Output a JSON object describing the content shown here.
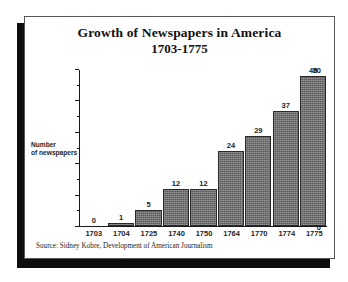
{
  "chart_data": {
    "type": "bar",
    "title": "Growth of Newspapers in America",
    "subtitle": "1703-1775",
    "xlabel": "",
    "ylabel": "Number of newspapers",
    "ylabel_line1": "Number",
    "ylabel_line2": "of newspapers",
    "categories": [
      "1703",
      "1704",
      "1725",
      "1740",
      "1750",
      "1764",
      "1770",
      "1774",
      "1775"
    ],
    "values": [
      0,
      1,
      5,
      12,
      12,
      24,
      29,
      37,
      48
    ],
    "value_labels": [
      "0",
      "1",
      "5",
      "12",
      "12",
      "24",
      "29",
      "37",
      "48"
    ],
    "ylim": [
      0,
      50
    ],
    "ytick_labels": [
      "0",
      "10",
      "20",
      "30",
      "40",
      "50"
    ],
    "ytick_values": [
      0,
      10,
      20,
      30,
      40,
      50
    ],
    "yminor_values": [
      5,
      15,
      25,
      35,
      45
    ],
    "grid": false,
    "legend": null,
    "bar_color": "#6e6e6e",
    "bar_edge_color": "#2a2a2a",
    "background_color": "#ffffff",
    "text_color": "#1d1d1d"
  },
  "source": {
    "note": "Source: Sidney Kobre, Development of American Journalism"
  },
  "frame": {
    "border_color": "#575757",
    "shadow_color": "#0d0d0d"
  }
}
